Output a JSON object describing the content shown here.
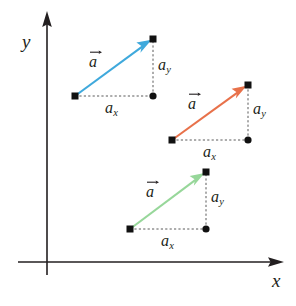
{
  "figure": {
    "kind": "vector-components-diagram",
    "background": "#ffffff",
    "width": 296,
    "height": 306
  },
  "axes": {
    "origin": {
      "x": 47,
      "y": 262
    },
    "x_axis": {
      "label": "x",
      "label_pos": {
        "x": 272,
        "y": 271
      },
      "from": {
        "x": 18,
        "y": 262
      },
      "to": {
        "x": 282,
        "y": 262
      },
      "color": "#231f20"
    },
    "y_axis": {
      "label": "y",
      "label_pos": {
        "x": 22,
        "y": 32
      },
      "from": {
        "x": 47,
        "y": 275
      },
      "to": {
        "x": 47,
        "y": 13
      },
      "color": "#231f20"
    }
  },
  "vectors": [
    {
      "id": "vector-blue",
      "color": "#3FA9DC",
      "label": "a",
      "label_pos": {
        "x": 89,
        "y": 54
      },
      "tail": {
        "x": 75,
        "y": 96
      },
      "tip": {
        "x": 153,
        "y": 39
      },
      "corner": {
        "x": 153,
        "y": 96
      },
      "component_x": {
        "label": "a",
        "subscript": "x",
        "pos": {
          "x": 105,
          "y": 100
        }
      },
      "component_y": {
        "label": "a",
        "subscript": "y",
        "pos": {
          "x": 158,
          "y": 57
        }
      }
    },
    {
      "id": "vector-orange",
      "color": "#E8714A",
      "label": "a",
      "label_pos": {
        "x": 188,
        "y": 96
      },
      "tail": {
        "x": 172,
        "y": 140
      },
      "tip": {
        "x": 248,
        "y": 85
      },
      "corner": {
        "x": 248,
        "y": 140
      },
      "component_x": {
        "label": "a",
        "subscript": "x",
        "pos": {
          "x": 203,
          "y": 144
        }
      },
      "component_y": {
        "label": "a",
        "subscript": "y",
        "pos": {
          "x": 253,
          "y": 101
        }
      }
    },
    {
      "id": "vector-green",
      "color": "#97D79A",
      "label": "a",
      "label_pos": {
        "x": 146,
        "y": 184
      },
      "tail": {
        "x": 130,
        "y": 229
      },
      "tip": {
        "x": 206,
        "y": 172
      },
      "corner": {
        "x": 206,
        "y": 229
      },
      "component_x": {
        "label": "a",
        "subscript": "x",
        "pos": {
          "x": 161,
          "y": 233
        }
      },
      "component_y": {
        "label": "a",
        "subscript": "y",
        "pos": {
          "x": 211,
          "y": 189
        }
      }
    }
  ],
  "markers": {
    "square_size": 7,
    "dot_radius": 3.6,
    "color": "#111111"
  }
}
